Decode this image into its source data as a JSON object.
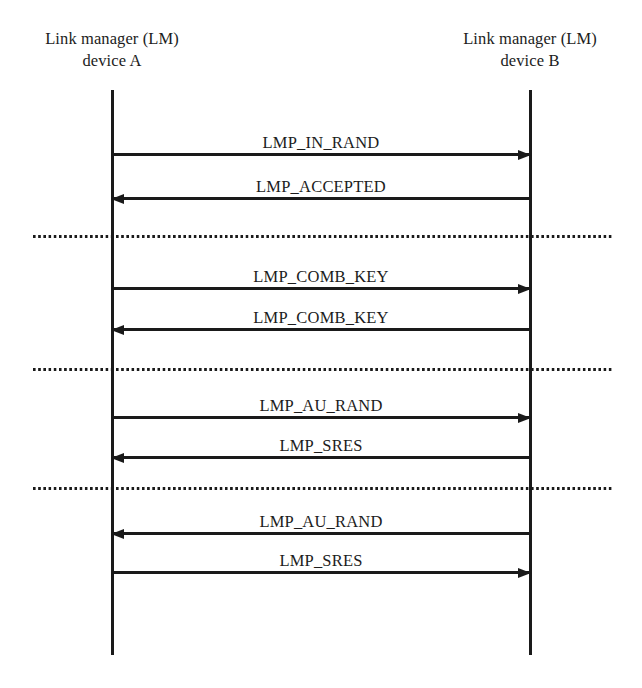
{
  "diagram": {
    "type": "sequence-diagram",
    "canvas": {
      "width": 642,
      "height": 688
    },
    "stroke_color": "#1a1a1a",
    "background_color": "#ffffff"
  },
  "lifelines": [
    {
      "id": "device-a",
      "role": "initiator",
      "header_line_1": "Link manager (LM)",
      "header_line_2": "device A",
      "x": 112,
      "label_center_x": 112,
      "label_top_y": 28,
      "line_top_y": 90,
      "line_bottom_y": 655
    },
    {
      "id": "device-b",
      "role": "responder",
      "header_line_1": "Link manager (LM)",
      "header_line_2": "device B",
      "x": 530,
      "label_center_x": 530,
      "label_top_y": 28,
      "line_top_y": 90,
      "line_bottom_y": 655
    }
  ],
  "messages": [
    {
      "index": 1,
      "label": "LMP_IN_RAND",
      "from": "device-a",
      "to": "device-b",
      "direction": "right",
      "y": 155,
      "phase": 1
    },
    {
      "index": 2,
      "label": "LMP_ACCEPTED",
      "from": "device-b",
      "to": "device-a",
      "direction": "left",
      "y": 199,
      "phase": 1
    },
    {
      "index": 3,
      "label": "LMP_COMB_KEY",
      "from": "device-a",
      "to": "device-b",
      "direction": "right",
      "y": 289,
      "phase": 2
    },
    {
      "index": 4,
      "label": "LMP_COMB_KEY",
      "from": "device-b",
      "to": "device-a",
      "direction": "left",
      "y": 330,
      "phase": 2
    },
    {
      "index": 5,
      "label": "LMP_AU_RAND",
      "from": "device-a",
      "to": "device-b",
      "direction": "right",
      "y": 418,
      "phase": 3
    },
    {
      "index": 6,
      "label": "LMP_SRES",
      "from": "device-b",
      "to": "device-a",
      "direction": "left",
      "y": 458,
      "phase": 3
    },
    {
      "index": 7,
      "label": "LMP_AU_RAND",
      "from": "device-b",
      "to": "device-a",
      "direction": "left",
      "y": 534,
      "phase": 4
    },
    {
      "index": 8,
      "label": "LMP_SRES",
      "from": "device-a",
      "to": "device-b",
      "direction": "right",
      "y": 573,
      "phase": 4
    }
  ],
  "phase_separators": [
    {
      "index": 1,
      "y": 235,
      "x_start": 33,
      "x_end": 612,
      "style": "dotted"
    },
    {
      "index": 2,
      "y": 368,
      "x_start": 33,
      "x_end": 612,
      "style": "dotted"
    },
    {
      "index": 3,
      "y": 487,
      "x_start": 33,
      "x_end": 612,
      "style": "dotted"
    }
  ]
}
